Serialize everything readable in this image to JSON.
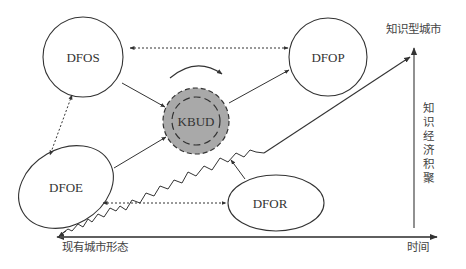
{
  "diagram": {
    "nodes": [
      {
        "id": "DFOS",
        "label": "DFOS",
        "shape": "circle"
      },
      {
        "id": "DFOP",
        "label": "DFOP",
        "shape": "circle"
      },
      {
        "id": "KBUD",
        "label": "KBUD",
        "shape": "double-dashed-circle",
        "fill": "#a9a9a9"
      },
      {
        "id": "DFOE",
        "label": "DFOE",
        "shape": "ellipse"
      },
      {
        "id": "DFOR",
        "label": "DFOR",
        "shape": "ellipse"
      }
    ],
    "edges": [
      {
        "from": "DFOP",
        "to": "DFOS",
        "style": "dotted",
        "direction": "both"
      },
      {
        "from": "DFOS",
        "to": "DFOE",
        "style": "dotted",
        "direction": "both"
      },
      {
        "from": "DFOE",
        "to": "DFOR",
        "style": "dotted",
        "direction": "both"
      },
      {
        "from": "DFOS",
        "to": "KBUD",
        "style": "solid",
        "direction": "forward"
      },
      {
        "from": "DFOE",
        "to": "KBUD",
        "style": "solid",
        "direction": "forward"
      },
      {
        "from": "KBUD",
        "to": "DFOP",
        "style": "solid",
        "direction": "forward"
      },
      {
        "from": "DFOR",
        "to": "KBUD-path",
        "style": "solid",
        "direction": "forward"
      }
    ],
    "axes": {
      "x_label": "时间",
      "y_label": "知识经济积聚",
      "y_label_chars": [
        "知",
        "识",
        "经",
        "济",
        "积",
        "聚"
      ],
      "top_label": "知识型城市",
      "origin_label": "现有城市形态"
    },
    "colors": {
      "line": "#333333",
      "kbud_fill": "#a9a9a9"
    }
  }
}
